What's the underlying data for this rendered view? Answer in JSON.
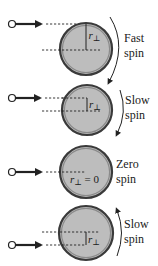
{
  "colors": {
    "disk_fill": "#bdbdbd",
    "disk_rim": "#3a3a3a",
    "ink": "#222222"
  },
  "panels": [
    {
      "id": "fast",
      "label_line1": "Fast",
      "label_line2": "spin",
      "r_label": "r",
      "r_sub": "⊥",
      "r_suffix": "",
      "spin_direction": "clockwise",
      "impact": "top-edge"
    },
    {
      "id": "slow1",
      "label_line1": "Slow",
      "label_line2": "spin",
      "r_label": "r",
      "r_sub": "⊥",
      "r_suffix": "",
      "spin_direction": "clockwise",
      "impact": "above-center"
    },
    {
      "id": "zero",
      "label_line1": "Zero",
      "label_line2": "spin",
      "r_label": "r",
      "r_sub": "⊥",
      "r_suffix": " = 0",
      "spin_direction": "none",
      "impact": "center"
    },
    {
      "id": "slow2",
      "label_line1": "Slow",
      "label_line2": "spin",
      "r_label": "r",
      "r_sub": "⊥",
      "r_suffix": "",
      "spin_direction": "counterclockwise",
      "impact": "below-center"
    }
  ]
}
